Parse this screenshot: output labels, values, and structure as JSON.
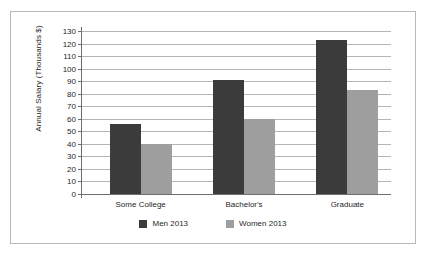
{
  "chart_data": {
    "type": "bar",
    "title": "",
    "xlabel": "",
    "ylabel": "Annual Salary (Thousands $)",
    "categories": [
      "Some College",
      "Bachelor's",
      "Graduate"
    ],
    "series": [
      {
        "name": "Men 2013",
        "color": "#3b3b3b",
        "values": [
          56,
          91,
          123
        ]
      },
      {
        "name": "Women 2013",
        "color": "#9e9e9e",
        "values": [
          40,
          60,
          83
        ]
      }
    ],
    "ylim": [
      0,
      130
    ],
    "ytick_step": 10,
    "yticks": [
      0,
      10,
      20,
      30,
      40,
      50,
      60,
      70,
      80,
      90,
      100,
      110,
      120,
      130
    ],
    "grid": "horizontal",
    "legend_position": "bottom",
    "frame": true
  }
}
